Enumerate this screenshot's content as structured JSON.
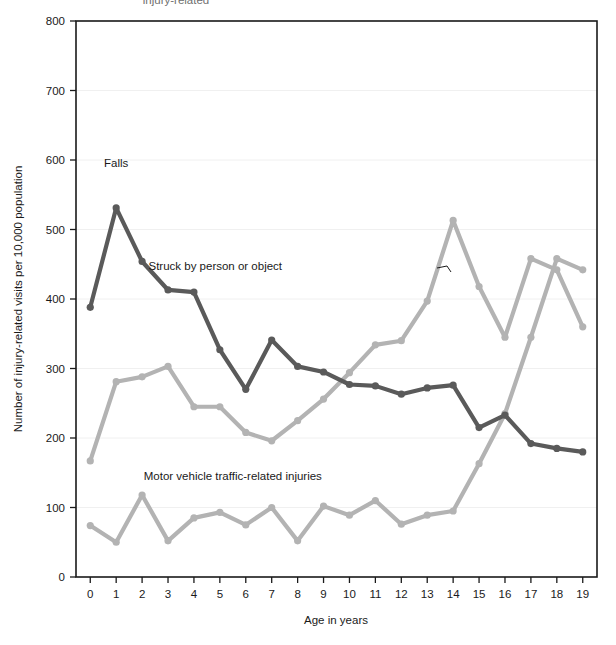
{
  "figure": {
    "top_clipped_text": "injury-related",
    "background_color": "#ffffff",
    "plot_border_color": "#1a1a1a",
    "gridline_color": "#f0f0f0"
  },
  "chart_data": {
    "type": "line",
    "title": "",
    "subtitle": "",
    "xlabel": "Age in years",
    "ylabel": "Number of injury-related visits per 10,000 population",
    "x": [
      0,
      1,
      2,
      3,
      4,
      5,
      6,
      7,
      8,
      9,
      10,
      11,
      12,
      13,
      14,
      15,
      16,
      17,
      18,
      19
    ],
    "xtick_labels": [
      "0",
      "1",
      "2",
      "3",
      "4",
      "5",
      "6",
      "7",
      "8",
      "9",
      "10",
      "11",
      "12",
      "13",
      "14",
      "15",
      "16",
      "17",
      "18",
      "19"
    ],
    "ytick_labels": [
      "0",
      "100",
      "200",
      "300",
      "400",
      "500",
      "600",
      "700",
      "800"
    ],
    "yticks": [
      0,
      100,
      200,
      300,
      400,
      500,
      600,
      700,
      800
    ],
    "xlim": [
      -0.55,
      19.55
    ],
    "ylim": [
      0,
      800
    ],
    "grid": "horizontal",
    "legend_position": "inline-annotations",
    "series": [
      {
        "name": "Falls",
        "color": "#5a5a5a",
        "label_text": "Falls",
        "label_x": 1,
        "label_y": 590,
        "values": [
          388,
          531,
          454,
          413,
          410,
          327,
          270,
          341,
          303,
          295,
          277,
          275,
          263,
          272,
          276,
          215,
          233,
          192,
          185,
          180
        ]
      },
      {
        "name": "Struck by person or object",
        "color": "#b3b3b3",
        "label_text": "Struck by person or object",
        "label_x": 7.4,
        "label_y": 442,
        "values": [
          167,
          281,
          288,
          303,
          245,
          245,
          208,
          196,
          225,
          256,
          294,
          334,
          340,
          397,
          513,
          418,
          345,
          458,
          442,
          360
        ]
      },
      {
        "name": "Motor vehicle traffic-related injuries",
        "color": "#b3b3b3",
        "label_text": "Motor vehicle traffic-related injuries",
        "label_x": 5.5,
        "label_y": 140,
        "values": [
          74,
          50,
          118,
          52,
          85,
          93,
          75,
          100,
          52,
          102,
          89,
          110,
          76,
          89,
          95,
          163,
          235,
          345,
          458,
          442
        ]
      }
    ],
    "annotations": [
      {
        "text": "Falls",
        "kind": "series-label"
      },
      {
        "text": "Struck by person or object",
        "kind": "series-label",
        "leader": true
      },
      {
        "text": "Motor vehicle traffic-related injuries",
        "kind": "series-label"
      }
    ]
  }
}
